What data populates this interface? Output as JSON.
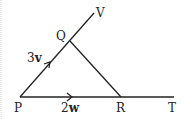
{
  "diagram": {
    "points": {
      "P": {
        "label": "P",
        "x": 20,
        "y": 97
      },
      "Q": {
        "label": "Q",
        "x": 70,
        "y": 41
      },
      "V": {
        "label": "V",
        "x": 94,
        "y": 13
      },
      "R": {
        "label": "R",
        "x": 121,
        "y": 97
      },
      "T": {
        "label": "T",
        "x": 174,
        "y": 97
      }
    },
    "vectors": {
      "PQ": {
        "coef": "3",
        "symbol": "v"
      },
      "PR": {
        "coef": "2",
        "symbol": "w"
      }
    },
    "colors": {
      "line": "#222222",
      "background": "#ffffff",
      "border": "#d8d8d8"
    }
  }
}
